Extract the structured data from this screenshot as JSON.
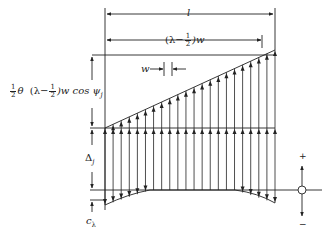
{
  "diagram": {
    "type": "structural load distribution diagram",
    "colors": {
      "line": "#222222",
      "background": "#ffffff"
    },
    "labels": {
      "span_length": "l",
      "offset_length_prefix": "(λ−",
      "offset_length_num": "1",
      "offset_length_den": "2",
      "offset_length_suffix": ")w",
      "spacing": "w",
      "rise_prefix_num": "1",
      "rise_prefix_den": "2",
      "rise_theta": "θ",
      "rise_mid_prefix": "(λ−",
      "rise_mid_num": "1",
      "rise_mid_den": "2",
      "rise_suffix": ")w cos ψ",
      "rise_subscript": "j",
      "delta": "Δ",
      "delta_subscript": "j",
      "c": "c",
      "c_subscript": "λ",
      "plus_sign": "+",
      "minus_sign": "−"
    },
    "vertical_member_count": 22
  }
}
